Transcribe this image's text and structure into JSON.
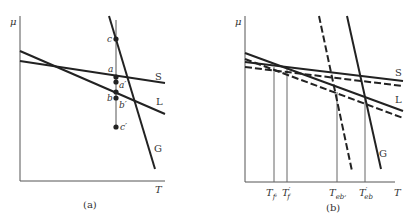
{
  "panels": [
    {
      "id": "a",
      "caption": "(a)",
      "y_axis_label": "μ",
      "x_axis_label": "T",
      "curves": [
        {
          "name": "S",
          "label": "S",
          "style": "solid"
        },
        {
          "name": "L",
          "label": "L",
          "style": "solid"
        },
        {
          "name": "G",
          "label": "G",
          "style": "solid"
        }
      ],
      "points": [
        {
          "name": "c",
          "label": "c"
        },
        {
          "name": "a",
          "label": "a"
        },
        {
          "name": "a-prime",
          "label": "a′"
        },
        {
          "name": "b",
          "label": "b"
        },
        {
          "name": "b-prime",
          "label": "b′"
        },
        {
          "name": "c-prime",
          "label": "c′"
        }
      ]
    },
    {
      "id": "b",
      "caption": "(b)",
      "y_axis_label": "μ",
      "x_axis_label": "T",
      "curves": [
        {
          "name": "S",
          "label": "S",
          "style": "solid+dashed"
        },
        {
          "name": "L",
          "label": "L",
          "style": "solid+dashed"
        },
        {
          "name": "G",
          "label": "G",
          "style": "solid+dashed"
        }
      ],
      "ticks": [
        {
          "name": "T_f",
          "base": "T",
          "sub": "f",
          "prime": "",
          "comma": ","
        },
        {
          "name": "T_f_prime",
          "base": "T",
          "sub": "f",
          "prime": "′",
          "comma": ""
        },
        {
          "name": "T_eb",
          "base": "T",
          "sub": "eb",
          "prime": "",
          "comma": ","
        },
        {
          "name": "T_eb_prime",
          "base": "T",
          "sub": "eb",
          "prime": "′",
          "comma": ""
        }
      ]
    }
  ],
  "colors": {
    "line": "#222222",
    "axis": "#555555",
    "text": "#333333"
  }
}
